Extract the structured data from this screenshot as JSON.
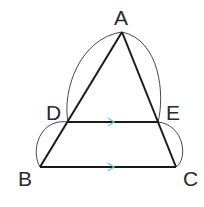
{
  "diagram": {
    "type": "geometry",
    "points": {
      "A": {
        "label": "A",
        "x": 122,
        "y": 32
      },
      "D": {
        "label": "D",
        "x": 68,
        "y": 122
      },
      "E": {
        "label": "E",
        "x": 158,
        "y": 122
      },
      "B": {
        "label": "B",
        "x": 40,
        "y": 167
      },
      "C": {
        "label": "C",
        "x": 176,
        "y": 167
      }
    },
    "segments": [
      "AB",
      "AC",
      "DE",
      "BC"
    ],
    "parallel_marks": [
      "DE",
      "BC"
    ],
    "arcs": [
      "AD",
      "AE",
      "DB",
      "EC"
    ],
    "colors": {
      "lines": "#1a1a1a",
      "arcs": "#333333",
      "arrow": "#5ec8e0"
    }
  }
}
